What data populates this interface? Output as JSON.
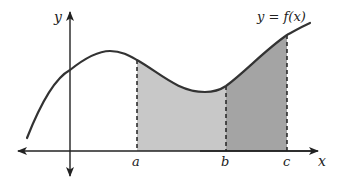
{
  "figure": {
    "curve_label": "y = f(x)",
    "axis_labels": {
      "x": "x",
      "y": "y"
    },
    "points": [
      {
        "id": "a",
        "label": "a"
      },
      {
        "id": "b",
        "label": "b"
      },
      {
        "id": "c",
        "label": "c"
      }
    ],
    "regions": [
      {
        "from": "a",
        "to": "b",
        "fill": "#c8c8c8"
      },
      {
        "from": "b",
        "to": "c",
        "fill": "#a4a4a4"
      }
    ],
    "colors": {
      "curve": "#333333",
      "axes": "#222222",
      "light_region": "#c8c8c8",
      "dark_region": "#a4a4a4"
    }
  }
}
